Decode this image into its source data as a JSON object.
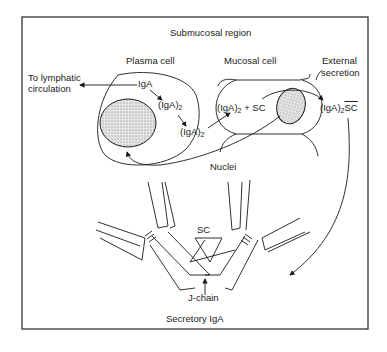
{
  "diagram": {
    "title": "Submucosal region",
    "caption": "Secretory IgA",
    "labels": {
      "plasma_cell": "Plasma cell",
      "mucosal_cell": "Mucosal cell",
      "external_secretion_line1": "External",
      "external_secretion_line2": "secretion",
      "to_lymphatic_line1": "To lymphatic",
      "to_lymphatic_line2": "circulation",
      "iga": "IgA",
      "iga2_a": "(IgA)",
      "iga2_a_sub": "2",
      "iga2_b": "(IgA)",
      "iga2_b_sub": "2",
      "iga2_sc": "(IgA)",
      "iga2_sc_sub": "2",
      "plus_sc": "+ SC",
      "iga2_sc_out": "(IgA)",
      "iga2_sc_out_sub": "2",
      "sc_suffix": "SC",
      "nuclei": "Nuclei",
      "sc": "SC",
      "j_chain": "J-chain"
    },
    "colors": {
      "line": "#1a1a1a",
      "frame": "#333333",
      "nucleus_fill": "#d8d8d8"
    }
  }
}
